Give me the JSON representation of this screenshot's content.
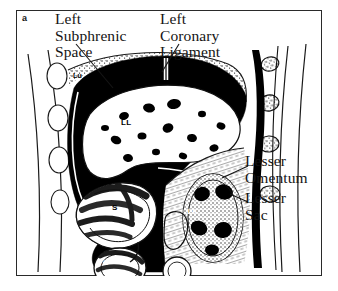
{
  "figure": {
    "panel_letter": "a",
    "background_color": "#ffffff",
    "ink_color": "#000000",
    "border_color": "#2a2a2a"
  },
  "callouts": [
    {
      "id": "left-subphrenic-space",
      "text": "Left\nSubphrenic\nSpace"
    },
    {
      "id": "left-coronary-ligament",
      "text": "Left\nCoronary\nLigament"
    },
    {
      "id": "lesser-omentum",
      "text": "Lesser\nOmentum"
    },
    {
      "id": "lesser-sac",
      "text": "Lesser\nSac"
    }
  ],
  "abbreviations": [
    {
      "id": "lung",
      "text": "Lu"
    },
    {
      "id": "left-lobe-liver",
      "text": "LL"
    },
    {
      "id": "stomach",
      "text": "S"
    },
    {
      "id": "transverse-colon",
      "text": "TC"
    },
    {
      "id": "pancreas",
      "text": "P"
    },
    {
      "id": "duodenum",
      "text": "D"
    },
    {
      "id": "left-kidney",
      "text": "LK"
    }
  ]
}
